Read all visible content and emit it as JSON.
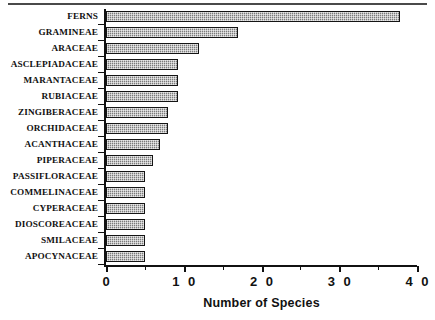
{
  "chart_data": {
    "type": "bar",
    "orientation": "horizontal",
    "title": "",
    "xlabel": "Number of Species",
    "ylabel": "",
    "xlim": [
      0,
      40
    ],
    "xticks": [
      0,
      10,
      20,
      30,
      40
    ],
    "xtick_labels": [
      "0",
      "1 0",
      "2 0",
      "3 0",
      "4 0"
    ],
    "minor_xticks": [
      5,
      15,
      25,
      35
    ],
    "grid": false,
    "legend": null,
    "categories": [
      "FERNS",
      "GRAMINEAE",
      "ARACEAE",
      "ASCLEPIADACEAE",
      "MARANTACEAE",
      "RUBIACEAE",
      "ZINGIBERACEAE",
      "ORCHIDACEAE",
      "ACANTHACEAE",
      "PIPERACEAE",
      "PASSIFLORACEAE",
      "COMMELINACEAE",
      "CYPERACEAE",
      "DIOSCOREACEAE",
      "SMILACEAE",
      "APOCYNACEAE"
    ],
    "values": [
      37.8,
      17.0,
      12.0,
      9.2,
      9.2,
      9.2,
      8.0,
      8.0,
      7.0,
      6.0,
      5.0,
      5.0,
      5.0,
      5.0,
      5.0,
      5.0
    ],
    "bar_fill_color": "#9d9d9d",
    "bar_edge_color": "#141414",
    "axis_color": "#111111"
  }
}
